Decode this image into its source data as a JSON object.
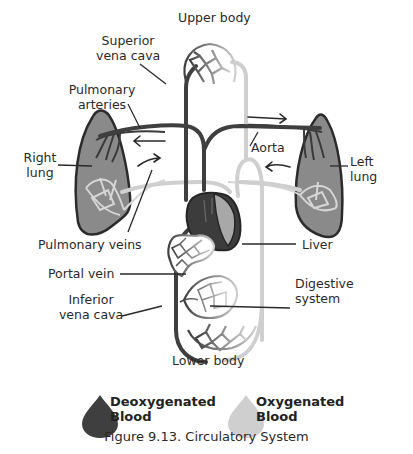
{
  "figure": {
    "caption": "Figure 9.13. Circulatory System",
    "colors": {
      "deoxygenated": "#3f3f3f",
      "oxygenated": "#cfcfcf",
      "lung_fill": "#8a8a8a",
      "outline": "#2b2b2b"
    }
  },
  "labels": {
    "upper_body": "Upper body",
    "superior_vena_cava": [
      "Superior",
      "vena cava"
    ],
    "pulmonary_arteries": [
      "Pulmonary",
      "arteries"
    ],
    "right_lung": [
      "Right",
      "lung"
    ],
    "left_lung": [
      "Left",
      "lung"
    ],
    "aorta": "Aorta",
    "pulmonary_veins": "Pulmonary veins",
    "liver": "Liver",
    "portal_vein": "Portal vein",
    "digestive_system": [
      "Digestive",
      "system"
    ],
    "inferior_vena_cava": [
      "Inferior",
      "vena cava"
    ],
    "lower_body": "Lower body"
  },
  "legend": {
    "items": [
      {
        "label": [
          "Deoxygenated",
          "Blood"
        ],
        "icon": "blood-drop-icon",
        "color": "#3f3f3f"
      },
      {
        "label": [
          "Oxygenated",
          "Blood"
        ],
        "icon": "blood-drop-icon",
        "color": "#cfcfcf"
      }
    ]
  }
}
